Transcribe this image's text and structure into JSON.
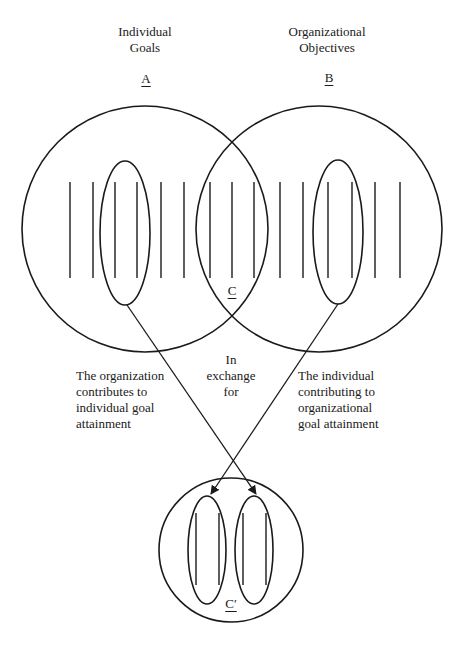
{
  "header": {
    "left_title_line1": "Individual",
    "left_title_line2": "Goals",
    "left_letter": "A",
    "right_title_line1": "Organizational",
    "right_title_line2": "Objectives",
    "right_letter": "B"
  },
  "overlap_label": "C",
  "result_label": "C′",
  "left_caption": [
    "The organization",
    "contributes to",
    "individual goal",
    "attainment"
  ],
  "center_caption": [
    "In",
    "exchange",
    "for"
  ],
  "right_caption": [
    "The individual",
    "contributing to",
    "organizational",
    "goal attainment"
  ],
  "colors": {
    "stroke": "#1a1a1a",
    "background": "#ffffff"
  }
}
